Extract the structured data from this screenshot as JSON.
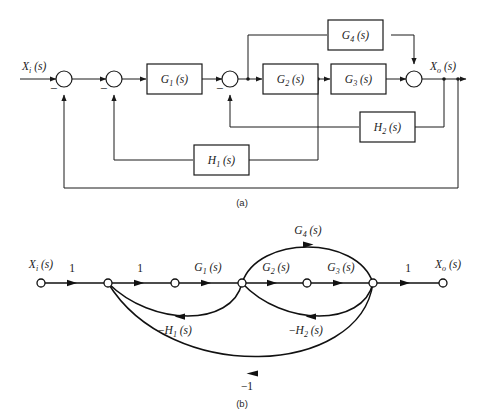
{
  "figure": {
    "panels": [
      {
        "id": "a",
        "caption": "(a)",
        "type": "block-diagram"
      },
      {
        "id": "b",
        "caption": "(b)",
        "type": "signal-flow-graph"
      }
    ]
  },
  "block_diagram": {
    "input_label": "X",
    "input_sub": "i",
    "input_arg": "(s)",
    "output_label": "X",
    "output_sub": "o",
    "output_arg": "(s)",
    "input_text": "Xi (s)",
    "output_text": "Xo (s)",
    "blocks": [
      {
        "name": "g1",
        "label": "G",
        "sub": "1",
        "arg": "(s)",
        "text": "G1 (s)"
      },
      {
        "name": "g2",
        "label": "G",
        "sub": "2",
        "arg": "(s)",
        "text": "G2 (s)"
      },
      {
        "name": "g3",
        "label": "G",
        "sub": "3",
        "arg": "(s)",
        "text": "G3 (s)"
      },
      {
        "name": "g4",
        "label": "G",
        "sub": "4",
        "arg": "(s)",
        "text": "G4 (s)"
      },
      {
        "name": "h1",
        "label": "H",
        "sub": "1",
        "arg": "(s)",
        "text": "H1 (s)"
      },
      {
        "name": "h2",
        "label": "H",
        "sub": "2",
        "arg": "(s)",
        "text": "H2 (s)"
      }
    ],
    "summing_junctions": [
      {
        "name": "sum-1",
        "sign": "−"
      },
      {
        "name": "sum-2",
        "sign": "−"
      },
      {
        "name": "sum-3",
        "sign": "−"
      },
      {
        "name": "sum-4",
        "sign": ""
      }
    ],
    "minus_sign": "−"
  },
  "flow_graph": {
    "input_label": "X",
    "input_sub": "i",
    "input_arg": "(s)",
    "output_label": "X",
    "output_sub": "o",
    "output_arg": "(s)",
    "input_text": "Xi (s)",
    "output_text": "Xo (s)",
    "branches": [
      {
        "name": "branch-unity-1",
        "text": "1"
      },
      {
        "name": "branch-unity-2",
        "text": "1"
      },
      {
        "name": "branch-g1",
        "label": "G",
        "sub": "1",
        "arg": "(s)",
        "text": "G1 (s)"
      },
      {
        "name": "branch-g2",
        "label": "G",
        "sub": "2",
        "arg": "(s)",
        "text": "G2 (s)"
      },
      {
        "name": "branch-g3",
        "label": "G",
        "sub": "3",
        "arg": "(s)",
        "text": "G3 (s)"
      },
      {
        "name": "branch-g4",
        "label": "G",
        "sub": "4",
        "arg": "(s)",
        "text": "G4 (s)"
      },
      {
        "name": "branch-h1",
        "prefix": "−",
        "label": "H",
        "sub": "1",
        "arg": "(s)",
        "text": "-H1 (s)"
      },
      {
        "name": "branch-h2",
        "prefix": "−",
        "label": "H",
        "sub": "2",
        "arg": "(s)",
        "text": "-H2 (s)"
      },
      {
        "name": "branch-unity-out",
        "text": "1"
      },
      {
        "name": "branch-negative-unity",
        "text": "−1"
      }
    ],
    "node_count": 7
  },
  "colors": {
    "ink": "#1a1a1a",
    "paper": "#ffffff",
    "caption": "#2a2a2a"
  }
}
